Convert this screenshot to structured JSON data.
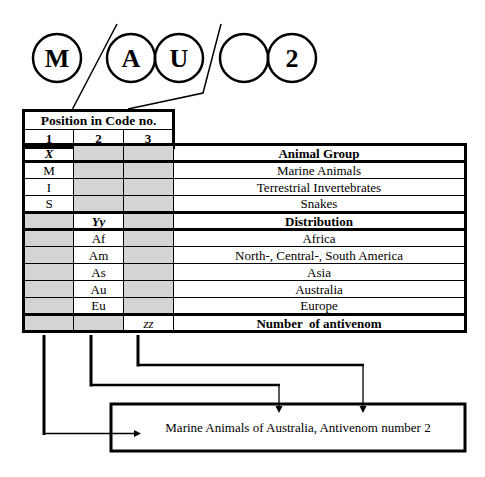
{
  "code": {
    "circles": [
      "M",
      "A",
      "U",
      "",
      "2"
    ]
  },
  "header": {
    "title": "Position in Code no.",
    "positions": [
      "1",
      "2",
      "3"
    ]
  },
  "table": {
    "rows": [
      {
        "c1": "X",
        "c2": "",
        "c3": "",
        "label": "Animal Group"
      },
      {
        "c1": "M",
        "c2": "",
        "c3": "",
        "label": "Marine Animals"
      },
      {
        "c1": "I",
        "c2": "",
        "c3": "",
        "label": "Terrestrial Invertebrates"
      },
      {
        "c1": "S",
        "c2": "",
        "c3": "",
        "label": "Snakes"
      },
      {
        "c1": "",
        "c2": "Yy",
        "c3": "",
        "label": "Distribution"
      },
      {
        "c1": "",
        "c2": "Af",
        "c3": "",
        "label": "Africa"
      },
      {
        "c1": "",
        "c2": "Am",
        "c3": "",
        "label": "North-, Central-, South America"
      },
      {
        "c1": "",
        "c2": "As",
        "c3": "",
        "label": "Asia"
      },
      {
        "c1": "",
        "c2": "Au",
        "c3": "",
        "label": "Australia"
      },
      {
        "c1": "",
        "c2": "Eu",
        "c3": "",
        "label": "Europe"
      },
      {
        "c1": "",
        "c2": "",
        "c3": "zz",
        "label": "Number  of antivenom"
      }
    ]
  },
  "result": {
    "text": "Marine Animals of Australia, Antivenom number 2"
  },
  "colors": {
    "shade": "#d4d4d4",
    "line": "#000000"
  }
}
